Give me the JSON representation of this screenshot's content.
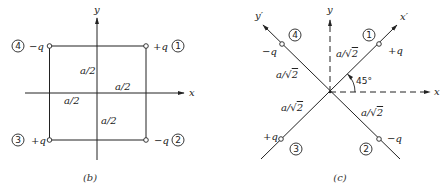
{
  "figure_b": {
    "caption": "(b)",
    "axes": {
      "x_label": "x",
      "y_label": "y"
    },
    "dimensions": {
      "upper_half": "a/2",
      "right_half": "a/2",
      "left_half": "a/2",
      "lower_half": "a/2"
    },
    "charges": [
      {
        "id": "1",
        "charge": "+q",
        "position": "top-right"
      },
      {
        "id": "2",
        "charge": "−q",
        "position": "bottom-right"
      },
      {
        "id": "3",
        "charge": "+q",
        "position": "bottom-left"
      },
      {
        "id": "4",
        "charge": "−q",
        "position": "top-left"
      }
    ]
  },
  "figure_c": {
    "caption": "(c)",
    "axes": {
      "x_label": "x",
      "y_label": "y",
      "x_prime_label": "x′",
      "y_prime_label": "y′"
    },
    "angle": "45°",
    "distances": {
      "to_1": "a/√2",
      "to_4": "a/√2",
      "to_3": "a/√2",
      "to_2": "a/√2"
    },
    "sqrt_symbol": "√",
    "distance_prefix": "a/",
    "distance_radicand": "2",
    "charges": [
      {
        "id": "1",
        "charge": "+q",
        "position": "upper-right on x′"
      },
      {
        "id": "2",
        "charge": "−q",
        "position": "lower-right on y′"
      },
      {
        "id": "3",
        "charge": "+q",
        "position": "lower-left on x′"
      },
      {
        "id": "4",
        "charge": "−q",
        "position": "upper-left on y′"
      }
    ]
  }
}
